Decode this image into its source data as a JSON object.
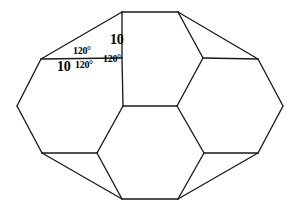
{
  "figure": {
    "stroke_color": "#1a1a1a",
    "fill_color": "#ffffff",
    "background_color": "#ffffff",
    "canvas": {
      "width": 299,
      "height": 211
    }
  },
  "labels": {
    "side_top": "10",
    "side_left": "10",
    "angle_upper": "120°",
    "angle_lower_left": "120°",
    "angle_right": "120°"
  },
  "geometry": {
    "vertices": {
      "top_left": [
        122,
        12
      ],
      "top_right": [
        178,
        12
      ],
      "upper_left_shoulder": [
        41,
        59
      ],
      "upper_left_inner": [
        122,
        58
      ],
      "upper_right_inner": [
        203,
        58
      ],
      "upper_right_shoulder": [
        258,
        59
      ],
      "left_point": [
        17,
        106
      ],
      "center_left": [
        123,
        106
      ],
      "center_right": [
        177,
        106
      ],
      "right_point": [
        283,
        106
      ],
      "lower_left_shoulder": [
        42,
        153
      ],
      "lower_left_inner": [
        97,
        153
      ],
      "lower_right_inner": [
        204,
        153
      ],
      "lower_right_shoulder": [
        258,
        153
      ],
      "bottom_left": [
        122,
        199
      ],
      "bottom_right": [
        178,
        199
      ]
    },
    "edges": [
      [
        [
          122,
          12
        ],
        [
          178,
          12
        ]
      ],
      [
        [
          122,
          12
        ],
        [
          41,
          59
        ]
      ],
      [
        [
          122,
          12
        ],
        [
          122,
          58
        ]
      ],
      [
        [
          178,
          12
        ],
        [
          203,
          58
        ]
      ],
      [
        [
          178,
          12
        ],
        [
          258,
          59
        ]
      ],
      [
        [
          41,
          59
        ],
        [
          122,
          58
        ]
      ],
      [
        [
          41,
          59
        ],
        [
          17,
          106
        ]
      ],
      [
        [
          122,
          58
        ],
        [
          123,
          106
        ]
      ],
      [
        [
          203,
          58
        ],
        [
          258,
          59
        ]
      ],
      [
        [
          203,
          58
        ],
        [
          177,
          106
        ]
      ],
      [
        [
          258,
          59
        ],
        [
          283,
          106
        ]
      ],
      [
        [
          17,
          106
        ],
        [
          42,
          153
        ]
      ],
      [
        [
          123,
          106
        ],
        [
          177,
          106
        ]
      ],
      [
        [
          123,
          106
        ],
        [
          97,
          153
        ]
      ],
      [
        [
          177,
          106
        ],
        [
          204,
          153
        ]
      ],
      [
        [
          283,
          106
        ],
        [
          258,
          153
        ]
      ],
      [
        [
          42,
          153
        ],
        [
          97,
          153
        ]
      ],
      [
        [
          42,
          153
        ],
        [
          122,
          199
        ]
      ],
      [
        [
          97,
          153
        ],
        [
          122,
          199
        ]
      ],
      [
        [
          204,
          153
        ],
        [
          258,
          153
        ]
      ],
      [
        [
          204,
          153
        ],
        [
          178,
          199
        ]
      ],
      [
        [
          258,
          153
        ],
        [
          178,
          199
        ]
      ],
      [
        [
          122,
          199
        ],
        [
          178,
          199
        ]
      ]
    ]
  }
}
